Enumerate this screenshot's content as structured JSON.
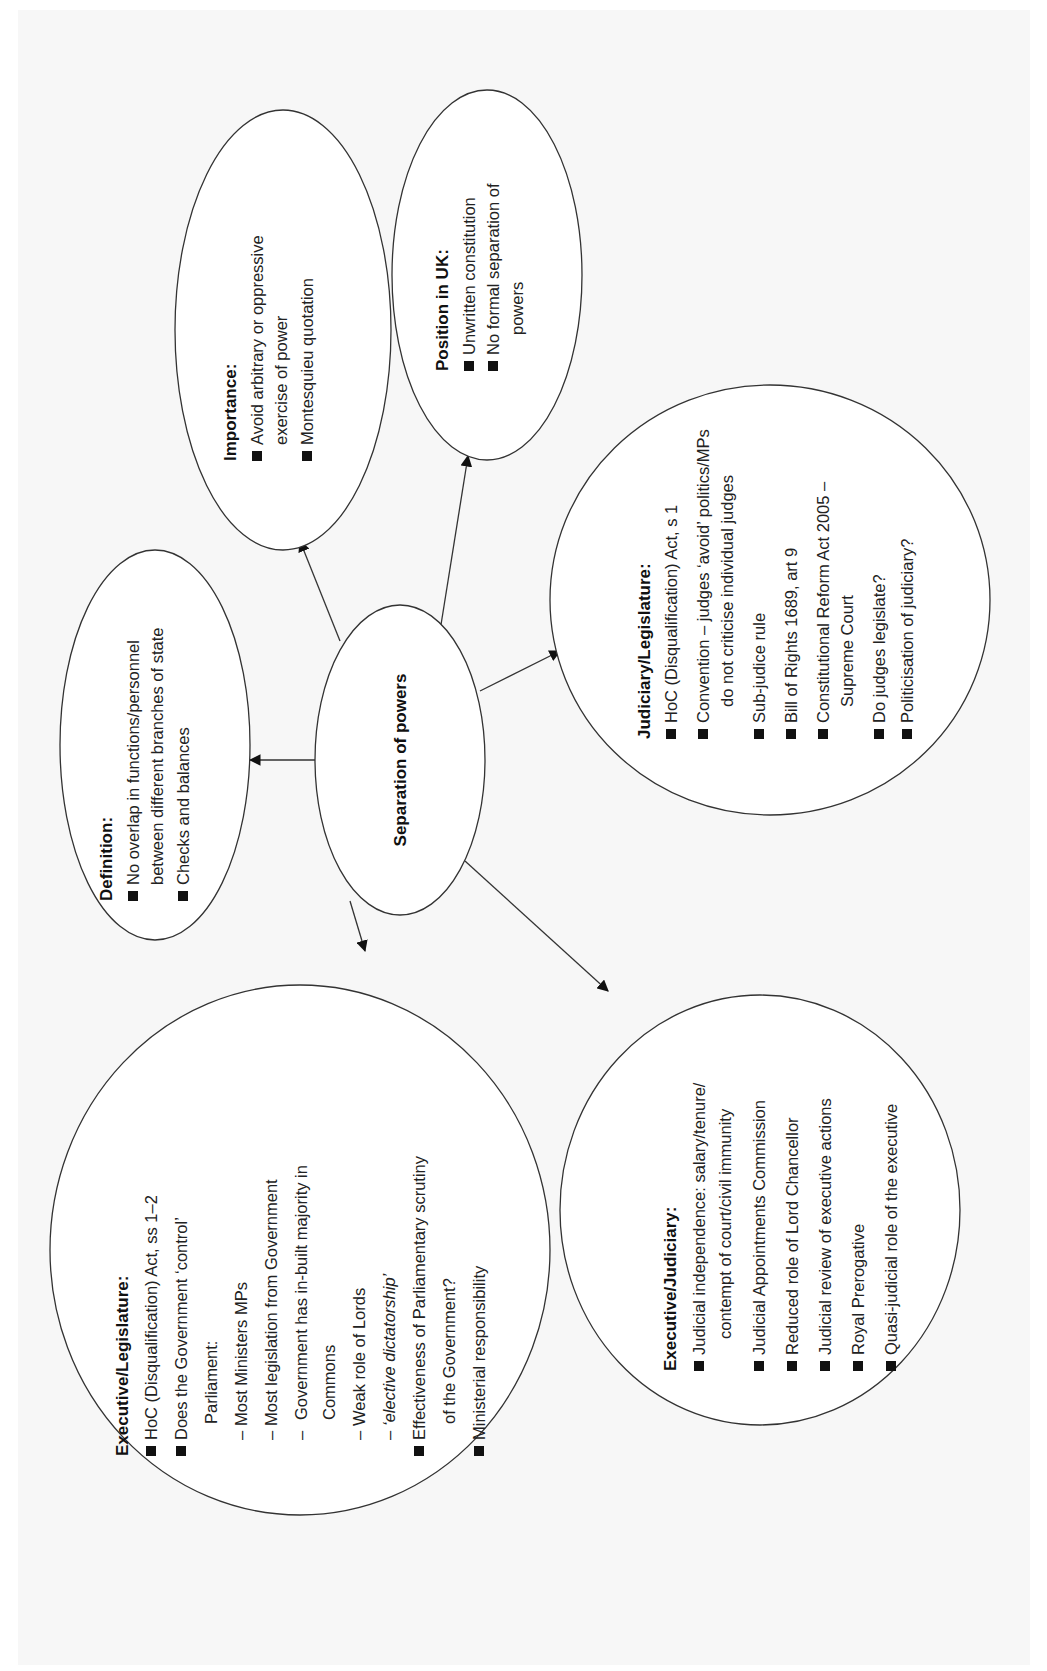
{
  "diagram": {
    "type": "mind-map",
    "orientation": "rotated-90-ccw",
    "center": {
      "label": "Separation of powers"
    },
    "nodes": {
      "definition": {
        "title": "Definition:",
        "items": [
          {
            "lines": [
              "No overlap in functions/personnel",
              "between different branches of state"
            ]
          },
          {
            "lines": [
              "Checks and balances"
            ]
          }
        ]
      },
      "importance": {
        "title": "Importance:",
        "items": [
          {
            "lines": [
              "Avoid arbitrary  or oppressive",
              "exercise of power"
            ]
          },
          {
            "lines": [
              "Montesquieu quotation"
            ]
          }
        ]
      },
      "position_uk": {
        "title": "Position in UK:",
        "items": [
          {
            "lines": [
              "Unwritten constitution"
            ]
          },
          {
            "lines": [
              "No formal separation of",
              "powers"
            ]
          }
        ]
      },
      "judiciary_legislature": {
        "title": "Judiciary/Legislature:",
        "items": [
          {
            "lines": [
              "HoC (Disqualification) Act, s 1"
            ]
          },
          {
            "lines": [
              "Convention – judges ‘avoid’ politics/MPs",
              "do not criticise individual judges"
            ]
          },
          {
            "lines": [
              "Sub-judice rule"
            ]
          },
          {
            "lines": [
              "Bill of Rights 1689, art 9"
            ]
          },
          {
            "lines": [
              "Constitutional Reform Act 2005 –",
              "Supreme Court"
            ]
          },
          {
            "lines": [
              "Do judges legislate?"
            ]
          },
          {
            "lines": [
              "Politicisation of judiciary?"
            ]
          }
        ]
      },
      "executive_legislature": {
        "title": "Executive/Legislature:",
        "items": [
          {
            "lines": [
              "HoC (Disqualification) Act, ss 1–2"
            ]
          },
          {
            "lines": [
              "Does the Government ‘control’",
              "Parliament:"
            ]
          },
          {
            "dash": true,
            "lines": [
              "Most Ministers MPs"
            ]
          },
          {
            "dash": true,
            "lines": [
              "Most legislation from Government"
            ]
          },
          {
            "dash": true,
            "lines": [
              "Government has in-built majority in",
              "Commons"
            ]
          },
          {
            "dash": true,
            "lines": [
              "Weak role of Lords"
            ]
          },
          {
            "dash": true,
            "italic": true,
            "lines": [
              "‘elective dictatorship’"
            ]
          },
          {
            "lines": [
              "Effectiveness of Parliamentary scrutiny",
              "of the Government?"
            ]
          },
          {
            "lines": [
              "Ministerial responsibility"
            ]
          }
        ]
      },
      "executive_judiciary": {
        "title": "Executive/Judiciary:",
        "items": [
          {
            "lines": [
              "Judicial independence: salary/tenure/",
              "contempt of court/civil immunity"
            ]
          },
          {
            "lines": [
              "Judicial Appointments Commission"
            ]
          },
          {
            "lines": [
              "Reduced role of Lord Chancellor"
            ]
          },
          {
            "lines": [
              "Judicial review of executive actions"
            ]
          },
          {
            "lines": [
              "Royal Prerogative"
            ]
          },
          {
            "lines": [
              "Quasi-judicial role of the executive"
            ]
          }
        ]
      }
    },
    "edges": [
      {
        "from": "center",
        "to": "definition"
      },
      {
        "from": "center",
        "to": "importance"
      },
      {
        "from": "center",
        "to": "position_uk"
      },
      {
        "from": "center",
        "to": "judiciary_legislature"
      },
      {
        "from": "center",
        "to": "executive_legislature"
      },
      {
        "from": "center",
        "to": "executive_judiciary"
      }
    ],
    "colors": {
      "stroke": "#333333",
      "fill": "#ffffff",
      "text": "#222222",
      "page": "#f7f7f7"
    }
  }
}
